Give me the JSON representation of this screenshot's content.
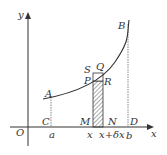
{
  "diagram": {
    "axes": {
      "x_label": "x",
      "y_label": "y",
      "origin": "O"
    },
    "points": {
      "A": "A",
      "B": "B",
      "C": "C",
      "D": "D",
      "M": "M",
      "N": "N",
      "P": "P",
      "Q": "Q",
      "R": "R",
      "S": "S"
    },
    "ticks": {
      "a": "a",
      "x": "x",
      "x_dx": "x+δx",
      "b": "b"
    },
    "colors": {
      "stroke": "#333333"
    }
  }
}
